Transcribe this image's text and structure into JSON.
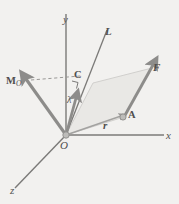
{
  "figure": {
    "background_color": "#f2f1ef",
    "ink_color": "#6f6e6d",
    "plane_fill": "#e6e5e2"
  },
  "axes": [
    {
      "name": "y-axis",
      "label": "y",
      "direction": "up"
    },
    {
      "name": "x-axis",
      "label": "x",
      "direction": "right"
    },
    {
      "name": "z-axis",
      "label": "z",
      "direction": "down-left"
    }
  ],
  "labels": {
    "axis_y": "y",
    "axis_x": "x",
    "axis_z": "z",
    "line_L": "L",
    "force_F": "F",
    "point_A": "A",
    "point_C": "C",
    "origin_O": "O",
    "moment_M": "M",
    "moment_M_subscript": "O",
    "unit_vector_lambda": "λ",
    "position_vector_r": "r"
  },
  "vectors": [
    {
      "name": "force-vector-F",
      "label": "F",
      "from": "A",
      "to": "tip",
      "style": "solid-arrow"
    },
    {
      "name": "moment-vector-MO",
      "label": "M",
      "sub": "O",
      "from": "O",
      "style": "solid-arrow"
    },
    {
      "name": "unit-vector-lambda",
      "label": "λ",
      "from": "O",
      "style": "solid-arrow"
    },
    {
      "name": "position-vector-r",
      "label": "r",
      "from": "O",
      "to": "A",
      "style": "thin-arrow"
    }
  ],
  "annotations": {
    "right_angle_marker": "right-angle between M_O projection and line L",
    "dashed_segment": "dashed line from M_O arrow tip to point C",
    "parallelogram": "shaded plane containing O, A and F"
  }
}
